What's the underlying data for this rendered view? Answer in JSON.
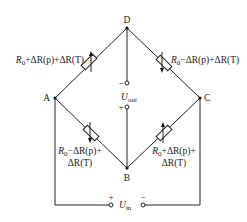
{
  "diagram": {
    "type": "wheatstone-bridge",
    "nodes": {
      "top": "D",
      "left": "A",
      "right": "C",
      "bottom": "B"
    },
    "resistors": {
      "AD": {
        "base": "R",
        "sub": "0",
        "rest": "+ΔR(p)+ΔR(T)"
      },
      "DC": {
        "base": "R",
        "sub": "0",
        "rest": "−ΔR(p)+ΔR(T)"
      },
      "AB": {
        "base": "R",
        "sub": "0",
        "line1_rest": "−ΔR(p)+",
        "line2": "ΔR(T)"
      },
      "BC": {
        "base": "R",
        "sub": "0",
        "line1_rest": "+ΔR(p)+",
        "line2": "ΔR(T)"
      }
    },
    "output": {
      "symbol": "U",
      "sub": "out",
      "minus": "−",
      "plus": "+"
    },
    "input": {
      "symbol": "U",
      "sub": "in",
      "plus": "+",
      "minus": "−"
    },
    "colors": {
      "line": "#222222",
      "background": "#ffffff"
    }
  }
}
